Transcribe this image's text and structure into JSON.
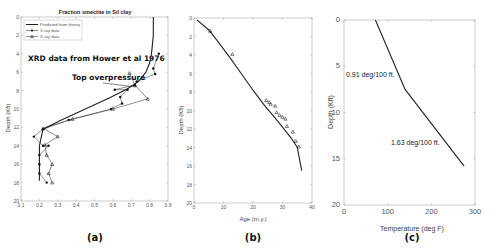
{
  "figure": {
    "captions": [
      "(a)",
      "(b)",
      "(c)"
    ]
  },
  "panel_a": {
    "title": "Fraction smectite in Sil clay",
    "ylabel": "Depth (Kft)",
    "legend": [
      "Predicted from theory",
      "X-ray data",
      "X-ray data"
    ],
    "annotation_source": "XRD data from Hower et al 1976",
    "annotation_pressure": "Top overpressure",
    "xticks": [
      "0.1",
      "0.2",
      "0.3",
      "0.4",
      "0.5",
      "0.6",
      "0.7",
      "0.8",
      "0.9"
    ],
    "yticks": [
      "0",
      "2",
      "4",
      "6",
      "8",
      "10",
      "12",
      "14",
      "16",
      "18",
      "20"
    ]
  },
  "panel_b": {
    "xlabel": "Age (m.y.)",
    "ylabel": "Depth (Kft)",
    "xticks": [
      "0",
      "10",
      "20",
      "30",
      "40"
    ],
    "yticks": [
      "0",
      "2",
      "4",
      "6",
      "8",
      "10",
      "12",
      "14",
      "16",
      "18",
      "20"
    ]
  },
  "panel_c": {
    "xlabel": "Temperature (deg F)",
    "ylabel": "Depth (Kft)",
    "annotation_upper": "0.91 deg/100 ft.",
    "annotation_lower": "1.63 deg/100 ft.",
    "xticks": [
      "0",
      "100",
      "200",
      "300"
    ],
    "yticks": [
      "0",
      "5",
      "10",
      "15",
      "20"
    ]
  },
  "chart_data": [
    {
      "type": "line",
      "title": "Fraction smectite in Sil clay",
      "xlabel": "",
      "ylabel": "Depth (Kft)",
      "xlim": [
        0.1,
        0.9
      ],
      "ylim": [
        20,
        0
      ],
      "grid": false,
      "legend_position": "upper left",
      "series": [
        {
          "name": "Predicted from theory",
          "style": "solid line",
          "x": [
            0.82,
            0.82,
            0.81,
            0.8,
            0.78,
            0.74,
            0.68,
            0.58,
            0.45,
            0.32,
            0.22,
            0.2,
            0.2
          ],
          "y": [
            0,
            2,
            4,
            5,
            6,
            7,
            7.8,
            8.8,
            10,
            11.2,
            12.2,
            14,
            17.8
          ]
        },
        {
          "name": "X-ray data (circles)",
          "style": "line with filled markers",
          "x": [
            0.85,
            0.82,
            0.83,
            0.73,
            0.72,
            0.61,
            0.68,
            0.64,
            0.65,
            0.59,
            0.36,
            0.22,
            0.17,
            0.22,
            0.25,
            0.2,
            0.2,
            0.2,
            0.24
          ],
          "y": [
            4,
            5.6,
            6.2,
            7,
            7.4,
            7.9,
            7.9,
            8.7,
            9.4,
            10,
            11.2,
            12.2,
            13,
            14,
            14,
            15,
            16,
            17,
            18
          ]
        },
        {
          "name": "X-ray data (triangles)",
          "style": "line with triangle markers",
          "x": [
            0.69,
            0.72,
            0.79,
            0.6,
            0.38,
            0.22,
            0.3,
            0.23,
            0.24,
            0.27,
            0.25,
            0.27
          ],
          "y": [
            6.1,
            7.4,
            8.9,
            10,
            11.1,
            12.1,
            13,
            13.9,
            15,
            16,
            17,
            18
          ]
        }
      ],
      "annotations": [
        "XRD data from Hower et al 1976",
        "Top overpressure"
      ]
    },
    {
      "type": "line",
      "title": "",
      "xlabel": "Age (m.y.)",
      "ylabel": "Depth (Kft)",
      "xlim": [
        0,
        40
      ],
      "ylim": [
        20,
        0
      ],
      "grid": false,
      "series": [
        {
          "name": "Age-depth curve",
          "style": "solid line",
          "x": [
            1,
            5,
            8,
            12,
            16,
            20,
            24,
            27,
            30,
            33,
            35,
            36.5
          ],
          "y": [
            0.2,
            1.3,
            2.5,
            4.2,
            6,
            7.8,
            9.5,
            10.6,
            11.8,
            13,
            14,
            16.5
          ]
        },
        {
          "name": "Data (triangles)",
          "style": "triangle markers",
          "x": [
            5.5,
            13,
            24.5,
            25.5,
            26,
            27.5,
            28,
            29,
            30,
            31,
            31.5,
            33.5,
            34.5,
            35.5
          ],
          "y": [
            1.4,
            3.9,
            8.9,
            9.1,
            9.3,
            9.5,
            10.2,
            10.5,
            10.7,
            10.9,
            11.7,
            12.3,
            13.3,
            13.9
          ]
        }
      ]
    },
    {
      "type": "line",
      "title": "",
      "xlabel": "Temperature (deg F)",
      "ylabel": "Depth (Kft)",
      "xlim": [
        0,
        300
      ],
      "ylim": [
        20,
        0
      ],
      "grid": false,
      "series": [
        {
          "name": "Temperature profile",
          "style": "solid line",
          "x": [
            72,
            140,
            275
          ],
          "y": [
            0,
            7.5,
            15.8
          ]
        }
      ],
      "annotations": [
        "0.91 deg/100 ft.",
        "1.63 deg/100 ft."
      ]
    }
  ]
}
